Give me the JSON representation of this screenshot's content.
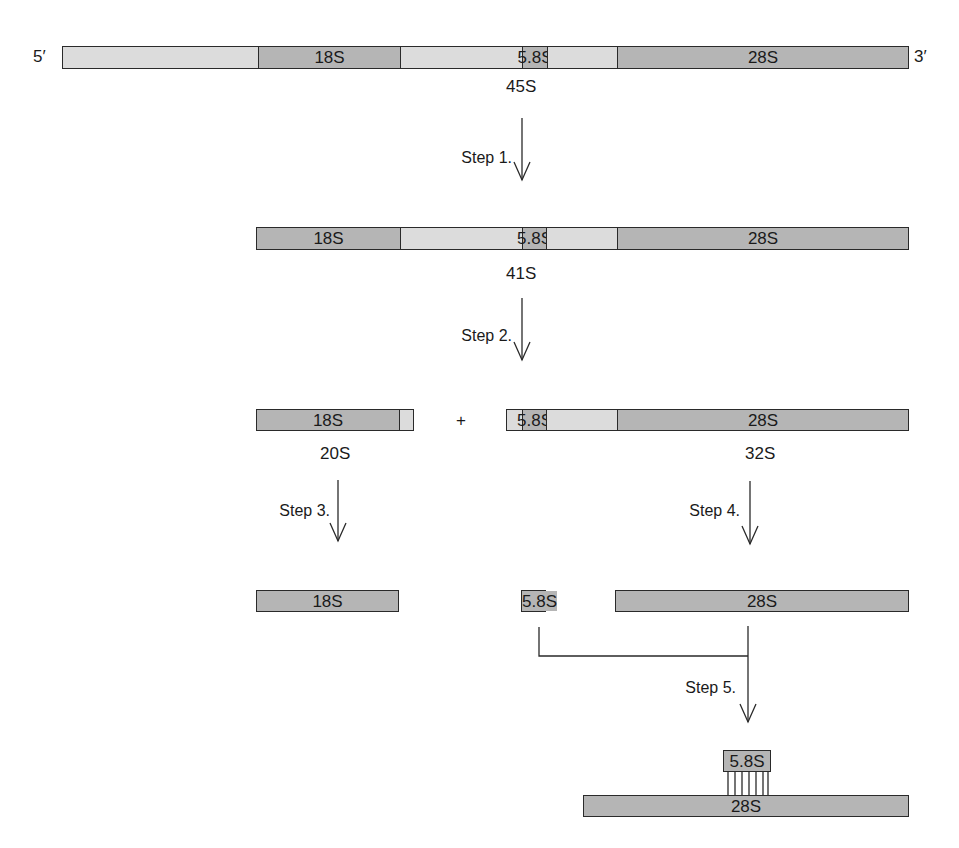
{
  "diagram": {
    "type": "rRNA processing pathway",
    "colors": {
      "spacer": "#dcdcdc",
      "mature_rna": "#b5b5b5",
      "outline": "#2a2a2a"
    },
    "ends": {
      "five_prime": "5′",
      "three_prime": "3′"
    },
    "precursor_45S": {
      "label": "45S",
      "segments": [
        "",
        "18S",
        "",
        "5.8S",
        "",
        "28S"
      ]
    },
    "step1": {
      "label": "Step 1."
    },
    "intermediate_41S": {
      "label": "41S",
      "segments": [
        "18S",
        "",
        "5.8S",
        "",
        "28S"
      ]
    },
    "step2": {
      "label": "Step 2."
    },
    "intermediate_20S": {
      "label": "20S",
      "segments": [
        "18S",
        ""
      ]
    },
    "plus": "+",
    "intermediate_32S": {
      "label": "32S",
      "segments": [
        "",
        "5.8S",
        "",
        "28S"
      ]
    },
    "step3": {
      "label": "Step 3."
    },
    "step4": {
      "label": "Step 4."
    },
    "mature_18S": {
      "label": "18S"
    },
    "mature_5_8S": {
      "label": "5.8S"
    },
    "mature_28S": {
      "label": "28S"
    },
    "step5": {
      "label": "Step 5."
    },
    "complex": {
      "small": "5.8S",
      "large": "28S",
      "base_pair_lines": 7
    }
  }
}
